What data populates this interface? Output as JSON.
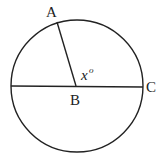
{
  "diagram": {
    "type": "circle-geometry",
    "circle": {
      "cx": 77,
      "cy": 86,
      "r": 66,
      "stroke": "#222222"
    },
    "points": {
      "A": {
        "label": "A",
        "x": 57,
        "y": 22
      },
      "B": {
        "label": "B",
        "x": 77,
        "y": 86
      },
      "C": {
        "label": "C",
        "x": 143,
        "y": 86
      }
    },
    "segments": [
      {
        "from": "A",
        "to": "B"
      },
      {
        "from": "left-edge",
        "to": "C"
      }
    ],
    "angle_label": {
      "text": "x",
      "superscript": "o"
    },
    "labels": {
      "A": "A",
      "B": "B",
      "C": "C",
      "angle_var": "x",
      "angle_deg": "o"
    }
  }
}
